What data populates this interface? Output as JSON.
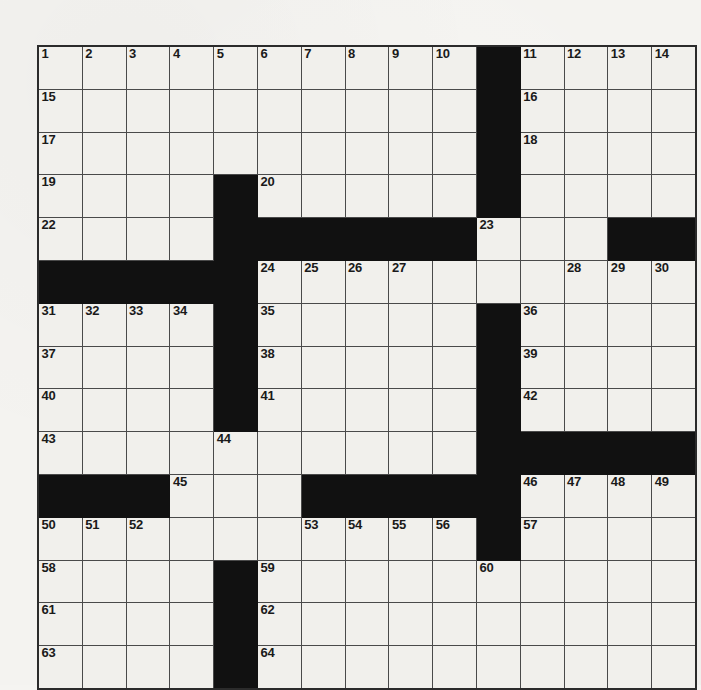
{
  "puzzle": {
    "title": "Crossword Puzzle Grid",
    "type": "crossword",
    "rows": 15,
    "cols": 15,
    "colors": {
      "paper": "#f4f3f0",
      "cell_fill": "#f1f0ec",
      "block_fill": "#111111",
      "grid_line": "#4a4a4a",
      "outer_border": "#2b2b2b",
      "number_color": "#1a1a1a"
    },
    "legend": {
      "block_symbol": "#",
      "open_symbol": "."
    },
    "grid": [
      "..........#....",
      "..........#....",
      "..........#....",
      "....#.....#....",
      "....######...##",
      "#####..........",
      "....#.....#....",
      "....#.....#....",
      "....#.....#....",
      "..........#####",
      "###...#####....",
      "..........#....",
      "....#..........",
      "....#..........",
      "....#.........."
    ],
    "numbers": [
      {
        "row": 0,
        "col": 0,
        "n": "1"
      },
      {
        "row": 0,
        "col": 1,
        "n": "2"
      },
      {
        "row": 0,
        "col": 2,
        "n": "3"
      },
      {
        "row": 0,
        "col": 3,
        "n": "4"
      },
      {
        "row": 0,
        "col": 4,
        "n": "5"
      },
      {
        "row": 0,
        "col": 5,
        "n": "6"
      },
      {
        "row": 0,
        "col": 6,
        "n": "7"
      },
      {
        "row": 0,
        "col": 7,
        "n": "8"
      },
      {
        "row": 0,
        "col": 8,
        "n": "9"
      },
      {
        "row": 0,
        "col": 9,
        "n": "10"
      },
      {
        "row": 0,
        "col": 11,
        "n": "11"
      },
      {
        "row": 0,
        "col": 12,
        "n": "12"
      },
      {
        "row": 0,
        "col": 13,
        "n": "13"
      },
      {
        "row": 0,
        "col": 14,
        "n": "14"
      },
      {
        "row": 1,
        "col": 0,
        "n": "15"
      },
      {
        "row": 1,
        "col": 11,
        "n": "16"
      },
      {
        "row": 2,
        "col": 0,
        "n": "17"
      },
      {
        "row": 2,
        "col": 11,
        "n": "18"
      },
      {
        "row": 3,
        "col": 0,
        "n": "19"
      },
      {
        "row": 3,
        "col": 5,
        "n": "20"
      },
      {
        "row": 3,
        "col": 10,
        "n": "21"
      },
      {
        "row": 4,
        "col": 0,
        "n": "22"
      },
      {
        "row": 4,
        "col": 10,
        "n": "23"
      },
      {
        "row": 5,
        "col": 5,
        "n": "24"
      },
      {
        "row": 5,
        "col": 6,
        "n": "25"
      },
      {
        "row": 5,
        "col": 7,
        "n": "26"
      },
      {
        "row": 5,
        "col": 8,
        "n": "27"
      },
      {
        "row": 5,
        "col": 12,
        "n": "28"
      },
      {
        "row": 5,
        "col": 13,
        "n": "29"
      },
      {
        "row": 5,
        "col": 14,
        "n": "30"
      },
      {
        "row": 6,
        "col": 0,
        "n": "31"
      },
      {
        "row": 6,
        "col": 1,
        "n": "32"
      },
      {
        "row": 6,
        "col": 2,
        "n": "33"
      },
      {
        "row": 6,
        "col": 3,
        "n": "34"
      },
      {
        "row": 6,
        "col": 5,
        "n": "35"
      },
      {
        "row": 6,
        "col": 11,
        "n": "36"
      },
      {
        "row": 7,
        "col": 0,
        "n": "37"
      },
      {
        "row": 7,
        "col": 5,
        "n": "38"
      },
      {
        "row": 7,
        "col": 11,
        "n": "39"
      },
      {
        "row": 8,
        "col": 0,
        "n": "40"
      },
      {
        "row": 8,
        "col": 5,
        "n": "41"
      },
      {
        "row": 8,
        "col": 11,
        "n": "42"
      },
      {
        "row": 9,
        "col": 0,
        "n": "43"
      },
      {
        "row": 9,
        "col": 4,
        "n": "44"
      },
      {
        "row": 10,
        "col": 3,
        "n": "45"
      },
      {
        "row": 10,
        "col": 11,
        "n": "46"
      },
      {
        "row": 10,
        "col": 12,
        "n": "47"
      },
      {
        "row": 10,
        "col": 13,
        "n": "48"
      },
      {
        "row": 10,
        "col": 14,
        "n": "49"
      },
      {
        "row": 11,
        "col": 0,
        "n": "50"
      },
      {
        "row": 11,
        "col": 1,
        "n": "51"
      },
      {
        "row": 11,
        "col": 2,
        "n": "52"
      },
      {
        "row": 11,
        "col": 6,
        "n": "53"
      },
      {
        "row": 11,
        "col": 7,
        "n": "54"
      },
      {
        "row": 11,
        "col": 8,
        "n": "55"
      },
      {
        "row": 11,
        "col": 9,
        "n": "56"
      },
      {
        "row": 11,
        "col": 11,
        "n": "57"
      },
      {
        "row": 12,
        "col": 0,
        "n": "58"
      },
      {
        "row": 12,
        "col": 5,
        "n": "59"
      },
      {
        "row": 12,
        "col": 10,
        "n": "60"
      },
      {
        "row": 13,
        "col": 0,
        "n": "61"
      },
      {
        "row": 13,
        "col": 5,
        "n": "62"
      },
      {
        "row": 14,
        "col": 0,
        "n": "63"
      },
      {
        "row": 14,
        "col": 5,
        "n": "64"
      }
    ],
    "letters": []
  }
}
